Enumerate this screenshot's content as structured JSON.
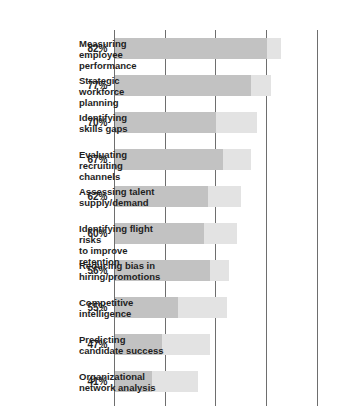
{
  "chart_data": {
    "type": "bar",
    "title": "",
    "subtitle": "",
    "xlabel": "",
    "ylabel": "",
    "orientation": "vertical-rotated-90",
    "grid": true,
    "legend": "none",
    "ylim": [
      0,
      100
    ],
    "ytick_labels": [
      "0%",
      "25%",
      "50%",
      "75%",
      "100%"
    ],
    "ytick_values": [
      0,
      25,
      50,
      75,
      100
    ],
    "categories": [
      "Measuring employee\nperformance",
      "Strategic workforce\nplanning",
      "Identifying\nskills gaps",
      "Evaluating recruiting\nchannels",
      "Assessing talent\nsupply/demand",
      "Identifying flight risks\nto improve retention",
      "Reducing bias in\nhiring/promotions",
      "Competitive\nintelligence",
      "Predicting\ncandidate success",
      "Organizational\nnetwork analysis"
    ],
    "values": [
      82,
      77,
      70,
      67,
      62,
      60,
      56,
      55,
      47,
      41
    ],
    "value_labels": [
      "82%",
      "77%",
      "70%",
      "67%",
      "62%",
      "60%",
      "56%",
      "55%",
      "47%",
      "41%"
    ],
    "series": [
      {
        "name": "lower-segment",
        "color": "#c2c2c2",
        "values": [
          75,
          67,
          50,
          53,
          46,
          44,
          47,
          31,
          23,
          18
        ]
      },
      {
        "name": "upper-segment",
        "color": "#e3e3e3",
        "values": [
          7,
          10,
          20,
          14,
          16,
          16,
          9,
          24,
          24,
          23
        ]
      }
    ],
    "colors": {
      "segment_lower": "#c2c2c2",
      "segment_upper": "#e3e3e3",
      "gridline": "#6e6e6e",
      "text": "#1e1e1e",
      "tick_text": "#3c3c3c",
      "background": "#ffffff"
    }
  }
}
